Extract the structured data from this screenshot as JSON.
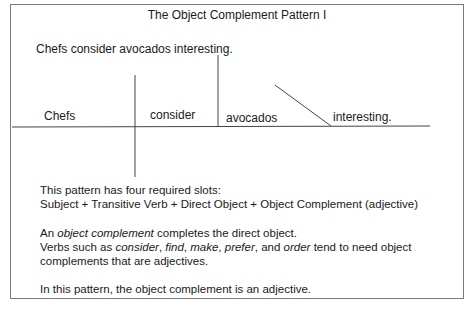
{
  "title": "The Object Complement Pattern I",
  "sentence": "Chefs consider avocados interesting.",
  "diagram": {
    "subject": "Chefs",
    "verb": "consider",
    "direct_object": "avocados",
    "object_complement": "interesting."
  },
  "notes": {
    "slots_intro": "This pattern has four required slots:",
    "slots_formula": "Subject + Transitive Verb + Direct Object + Object Complement (adjective)",
    "def_prefix": "An ",
    "def_term": "object complement",
    "def_suffix": " completes the direct object.",
    "verbs_prefix": "Verbs such as ",
    "verbs": [
      "consider",
      "find",
      "make",
      "prefer",
      "order"
    ],
    "verbs_suffix": " tend to need object",
    "verbs_line2": "complements that are adjectives.",
    "conclusion": "In this pattern, the object complement is an adjective."
  }
}
